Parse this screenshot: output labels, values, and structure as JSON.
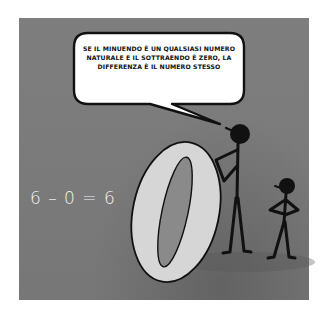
{
  "illustration": {
    "speech_bubble": {
      "text": "SE IL MINUENDO È UN QUALSIASI NUMERO NATURALE E IL SOTTRAENDO È ZERO, LA DIFFERENZA È IL NUMERO STESSO"
    },
    "equation": "6 – 0 = 6",
    "big_digit": "0",
    "characters": [
      "tall-stick-figure",
      "short-stick-figure"
    ],
    "colors": {
      "panel_background": "#7b7b7b",
      "digit_fill": "#d6d6d6",
      "digit_hole": "#8a8a8a",
      "ink": "#111111",
      "bubble_fill": "#ffffff",
      "equation_text": "#f2f2f2"
    }
  }
}
